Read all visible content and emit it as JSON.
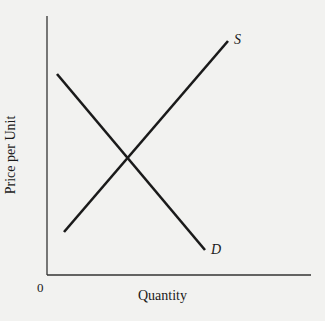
{
  "diagram": {
    "type": "supply-demand",
    "axes": {
      "x_label": "Quantity",
      "y_label": "Price per Unit",
      "origin_label": "0"
    },
    "curves": [
      {
        "name": "supply",
        "label": "S",
        "from": [
          64,
          232
        ],
        "to": [
          228,
          41
        ]
      },
      {
        "name": "demand",
        "label": "D",
        "from": [
          57,
          74
        ],
        "to": [
          205,
          250
        ]
      }
    ],
    "colors": {
      "line": "#1a1a1a",
      "axis": "#333333",
      "background": "#f2f2f0"
    }
  }
}
